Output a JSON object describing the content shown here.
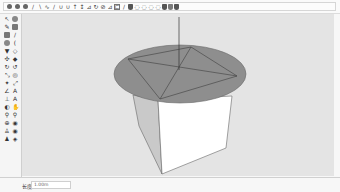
{
  "app": {
    "name": "3D modeling application"
  },
  "toolbar": {
    "icons": [
      {
        "name": "select-icon",
        "glyph": ""
      },
      {
        "name": "component-icon",
        "glyph": ""
      },
      {
        "name": "paint-bucket-icon",
        "glyph": ""
      },
      {
        "name": "line-icon",
        "glyph": "/"
      },
      {
        "name": "arc-icon",
        "glyph": "∖"
      },
      {
        "name": "freehand-icon",
        "glyph": "∿"
      },
      {
        "name": "pencil-icon",
        "glyph": "/"
      },
      {
        "name": "push-pull-icon",
        "glyph": "∪"
      },
      {
        "name": "offset-icon",
        "glyph": "∪"
      },
      {
        "name": "move-icon",
        "glyph": "↑"
      },
      {
        "name": "rotate-icon",
        "glyph": "↕"
      },
      {
        "name": "scale-icon",
        "glyph": "⊿"
      },
      {
        "name": "follow-me-icon",
        "glyph": "↻"
      },
      {
        "name": "tape-measure-icon",
        "glyph": "⊘"
      },
      {
        "name": "protractor-icon",
        "glyph": "⊿"
      },
      {
        "name": "text-icon",
        "glyph": "⊏"
      },
      {
        "name": "dimension-icon",
        "glyph": "/"
      },
      {
        "name": "section-plane-icon",
        "glyph": ""
      },
      {
        "name": "orbit-icon",
        "glyph": "◌"
      },
      {
        "name": "pan-icon",
        "glyph": "◌"
      },
      {
        "name": "zoom-icon",
        "glyph": "◌"
      },
      {
        "name": "zoom-extents-icon",
        "glyph": "◌"
      },
      {
        "name": "warehouse-icon",
        "glyph": ""
      },
      {
        "name": "extension-warehouse-icon",
        "glyph": ""
      },
      {
        "name": "layout-icon",
        "glyph": ""
      }
    ]
  },
  "sidebar": {
    "tools": [
      {
        "name": "select-tool-icon",
        "glyph": "↖"
      },
      {
        "name": "eraser-tool-icon",
        "glyph": ""
      },
      {
        "name": "lasso-tool-icon",
        "glyph": "✎"
      },
      {
        "name": "paint-tool-icon",
        "glyph": ""
      },
      {
        "name": "rectangle-tool-icon",
        "glyph": ""
      },
      {
        "name": "line-tool-icon",
        "glyph": "/"
      },
      {
        "name": "circle-tool-icon",
        "glyph": ""
      },
      {
        "name": "arc-tool-icon",
        "glyph": "("
      },
      {
        "name": "polygon-tool-icon",
        "glyph": "▼"
      },
      {
        "name": "freehand-tool-icon",
        "glyph": "◇"
      },
      {
        "name": "move-tool-icon",
        "glyph": "✣"
      },
      {
        "name": "push-pull-tool-icon",
        "glyph": "◆"
      },
      {
        "name": "rotate-tool-icon",
        "glyph": "↻"
      },
      {
        "name": "follow-me-tool-icon",
        "glyph": "↺"
      },
      {
        "name": "scale-tool-icon",
        "glyph": "⤡"
      },
      {
        "name": "offset-tool-icon",
        "glyph": "◎"
      },
      {
        "name": "tape-tool-icon",
        "glyph": "✦"
      },
      {
        "name": "dimension-tool-icon",
        "glyph": "⤢"
      },
      {
        "name": "protractor-tool-icon",
        "glyph": "∠"
      },
      {
        "name": "text-tool-icon",
        "glyph": "A"
      },
      {
        "name": "axes-tool-icon",
        "glyph": "⊥"
      },
      {
        "name": "3d-text-tool-icon",
        "glyph": "A"
      },
      {
        "name": "orbit-tool-icon",
        "glyph": "◐"
      },
      {
        "name": "pan-tool-icon",
        "glyph": "✋"
      },
      {
        "name": "zoom-tool-icon",
        "glyph": "⚲"
      },
      {
        "name": "zoom-window-tool-icon",
        "glyph": "⚲"
      },
      {
        "name": "zoom-extents-tool-icon",
        "glyph": "⊕"
      },
      {
        "name": "previous-view-tool-icon",
        "glyph": "◉"
      },
      {
        "name": "position-camera-tool-icon",
        "glyph": "♙"
      },
      {
        "name": "look-around-tool-icon",
        "glyph": "◉"
      },
      {
        "name": "walk-tool-icon",
        "glyph": "♟"
      },
      {
        "name": "section-tool-icon",
        "glyph": "◈"
      }
    ]
  },
  "viewport": {
    "background": "#e4e4e4",
    "scene": {
      "disk_color": "#8e8e8e",
      "box_left_face_color": "#c9c9c9",
      "box_right_face_color": "#ffffff",
      "edge_color": "#555555"
    }
  },
  "statusbar": {
    "measurement_label": "长度",
    "measurement_value": "1.00m"
  }
}
